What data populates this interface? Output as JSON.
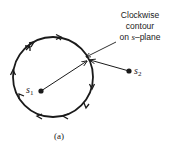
{
  "diagram": {
    "annotation": {
      "line1": "Clockwise",
      "line2": "contour",
      "line3_prefix": "on ",
      "line3_var": "s",
      "line3_suffix": "–plane"
    },
    "points": {
      "s1": {
        "base": "s",
        "sub": "1"
      },
      "s2": {
        "base": "s",
        "sub": "2"
      }
    },
    "caption": "(a)",
    "colors": {
      "stroke": "#1a1a1a",
      "background": "#ffffff"
    }
  }
}
